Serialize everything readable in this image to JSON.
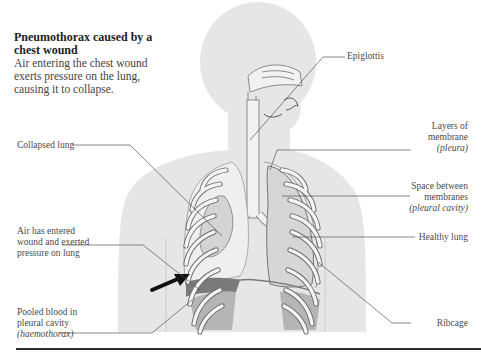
{
  "title_block": {
    "title": "Pneumothorax caused by a chest wound",
    "description": "Air entering the chest wound exerts pressure on the lung, causing it to collapse."
  },
  "labels": {
    "epiglottis": "Epiglottis",
    "collapsed_lung": "Collapsed lung",
    "air_entered": [
      "Air has entered",
      "wound and exerted",
      "pressure on lung"
    ],
    "pooled_blood": [
      "Pooled blood in",
      "pleural cavity"
    ],
    "pooled_blood_term": "(haemothorax)",
    "layers_membrane": [
      "Layers of",
      "membrane"
    ],
    "layers_membrane_term": "(pleura)",
    "space_between": [
      "Space between",
      "membranes"
    ],
    "space_between_term": "(pleural cavity)",
    "healthy_lung": "Healthy lung",
    "ribcage": "Ribcage"
  },
  "colors": {
    "body_fill": "#e6e6e6",
    "lung_fill": "#d9d9d9",
    "rib_fill": "#f2f2f2",
    "blood_fill": "#7a7a7a",
    "leader_line": "#555555",
    "arrow": "#111111",
    "rule": "#2e2e2e"
  }
}
